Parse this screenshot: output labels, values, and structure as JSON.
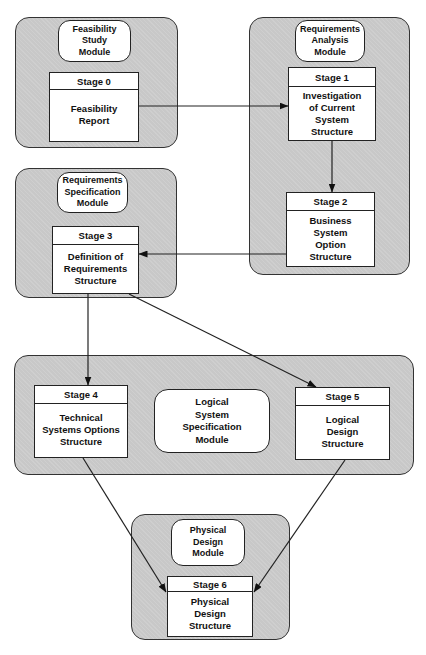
{
  "modules": {
    "feasibility": {
      "label": "Feasibility\nStudy\nModule"
    },
    "req_analysis": {
      "label": "Requirements\nAnalysis\nModule"
    },
    "req_spec": {
      "label": "Requirements\nSpecification\nModule"
    },
    "logical": {
      "label": "Logical\nSystem\nSpecification\nModule"
    },
    "physical": {
      "label": "Physical\nDesign\nModule"
    }
  },
  "stages": [
    {
      "header": "Stage 0",
      "body": "Feasibility\nReport"
    },
    {
      "header": "Stage 1",
      "body": "Investigation\nof Current\nSystem\nStructure"
    },
    {
      "header": "Stage 2",
      "body": "Business\nSystem\nOption\nStructure"
    },
    {
      "header": "Stage 3",
      "body": "Definition of\nRequirements\nStructure"
    },
    {
      "header": "Stage 4",
      "body": "Technical\nSystems Options\nStructure"
    },
    {
      "header": "Stage 5",
      "body": "Logical\nDesign\nStructure"
    },
    {
      "header": "Stage 6",
      "body": "Physical\nDesign\nStructure"
    }
  ],
  "flows": [
    {
      "from": "Stage 0",
      "to": "Stage 1"
    },
    {
      "from": "Stage 1",
      "to": "Stage 2"
    },
    {
      "from": "Stage 2",
      "to": "Stage 3"
    },
    {
      "from": "Stage 3",
      "to": "Stage 4"
    },
    {
      "from": "Stage 3",
      "to": "Stage 5"
    },
    {
      "from": "Stage 4",
      "to": "Stage 6"
    },
    {
      "from": "Stage 5",
      "to": "Stage 6"
    }
  ],
  "colors": {
    "module_fill": "#c8c8c8",
    "box_fill": "#ffffff",
    "line": "#222222"
  }
}
